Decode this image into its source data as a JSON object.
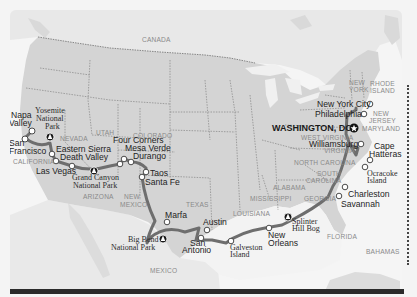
{
  "map": {
    "title": "US road trip route",
    "colors": {
      "land_us": "#d6d6d6",
      "land_other": "#e7e7e7",
      "water": "#f7f7f7",
      "route": "#6e6e6e",
      "border": "#9a9a9a",
      "stop_fill": "#ffffff",
      "stop_stroke": "#4a4a4a",
      "park_fill": "#1a1a1a",
      "capital_fill": "#111111"
    },
    "countries": [
      {
        "id": "canada",
        "label": "CANADA"
      },
      {
        "id": "mexico",
        "label": "MEXICO"
      },
      {
        "id": "bahamas",
        "label": "BAHAMAS"
      }
    ],
    "states": [
      {
        "id": "nevada",
        "label": "NEVADA"
      },
      {
        "id": "utah",
        "label": "UTAH"
      },
      {
        "id": "colorado",
        "label": "COLORADO"
      },
      {
        "id": "california",
        "label": "CALIFORNIA"
      },
      {
        "id": "arizona",
        "label": "ARIZONA"
      },
      {
        "id": "new-mexico",
        "label_line1": "NEW",
        "label_line2": "MEXICO"
      },
      {
        "id": "texas",
        "label": "TEXAS"
      },
      {
        "id": "louisiana",
        "label": "LOUISIANA"
      },
      {
        "id": "mississippi",
        "label": "MISSISSIPPI"
      },
      {
        "id": "alabama",
        "label": "ALABAMA"
      },
      {
        "id": "georgia",
        "label": "GEORGIA"
      },
      {
        "id": "florida",
        "label": "FLORIDA"
      },
      {
        "id": "south-carolina",
        "label_line1": "SOUTH",
        "label_line2": "CAROLINA"
      },
      {
        "id": "north-carolina",
        "label": "NORTH CAROLINA"
      },
      {
        "id": "virginia",
        "label": "VIRGINIA"
      },
      {
        "id": "west-virginia",
        "label": "WEST VIRGINIA"
      },
      {
        "id": "maryland",
        "label": "MARYLAND"
      },
      {
        "id": "new-jersey",
        "label_line1": "NEW",
        "label_line2": "JERSEY"
      },
      {
        "id": "new-york",
        "label_line1": "NEW",
        "label_line2": "YORK"
      },
      {
        "id": "rhode-island",
        "label_line1": "RHODE",
        "label_line2": "ISLAND"
      }
    ],
    "stops": [
      {
        "id": "napa-valley",
        "type": "city",
        "label_line1": "Napa",
        "label_line2": "Valley"
      },
      {
        "id": "san-francisco",
        "type": "city",
        "label_line1": "San",
        "label_line2": "Francisco"
      },
      {
        "id": "yosemite",
        "type": "park",
        "label_line1": "Yosemite",
        "label_line2": "National",
        "label_line3": "Park"
      },
      {
        "id": "eastern-sierra",
        "type": "city",
        "label": "Eastern Sierra"
      },
      {
        "id": "death-valley",
        "type": "city",
        "label": "Death Valley"
      },
      {
        "id": "las-vegas",
        "type": "city",
        "label": "Las Vegas"
      },
      {
        "id": "grand-canyon",
        "type": "park",
        "label_line1": "Grand Canyon",
        "label_line2": "National Park"
      },
      {
        "id": "four-corners",
        "type": "city",
        "label": "Four Corners"
      },
      {
        "id": "mesa-verde",
        "type": "city",
        "label": "Mesa Verde"
      },
      {
        "id": "durango",
        "type": "city",
        "label": "Durango"
      },
      {
        "id": "taos",
        "type": "city",
        "label": "Taos"
      },
      {
        "id": "santa-fe",
        "type": "city",
        "label": "Santa Fe"
      },
      {
        "id": "marfa",
        "type": "city",
        "label": "Marfa"
      },
      {
        "id": "big-bend",
        "type": "park",
        "label_line1": "Big Bend",
        "label_line2": "National Park"
      },
      {
        "id": "austin",
        "type": "city",
        "label": "Austin"
      },
      {
        "id": "san-antonio",
        "type": "city",
        "label_line1": "San",
        "label_line2": "Antonio"
      },
      {
        "id": "galveston",
        "type": "city",
        "label_line1": "Galveston",
        "label_line2": "Island"
      },
      {
        "id": "new-orleans",
        "type": "city",
        "label_line1": "New",
        "label_line2": "Orleans"
      },
      {
        "id": "splinter-hill-bog",
        "type": "park",
        "label_line1": "Splinter",
        "label_line2": "Hill Bog"
      },
      {
        "id": "savannah",
        "type": "city",
        "label": "Savannah"
      },
      {
        "id": "charleston",
        "type": "city",
        "label": "Charleston"
      },
      {
        "id": "ocracoke",
        "type": "city",
        "label_line1": "Ocracoke",
        "label_line2": "Island"
      },
      {
        "id": "cape-hatteras",
        "type": "city",
        "label_line1": "Cape",
        "label_line2": "Hatteras"
      },
      {
        "id": "williamsburg",
        "type": "city",
        "label": "Williamsburg"
      },
      {
        "id": "washington-dc",
        "type": "capital",
        "label": "WASHINGTON, DC"
      },
      {
        "id": "philadelphia",
        "type": "city",
        "label": "Philadelphia"
      },
      {
        "id": "new-york-city",
        "type": "city",
        "label": "New York City"
      }
    ]
  }
}
